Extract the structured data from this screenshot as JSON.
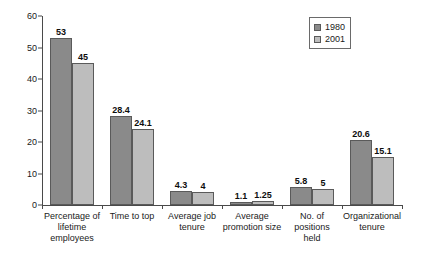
{
  "chart_data": {
    "type": "bar",
    "title": "",
    "xlabel": "",
    "ylabel": "",
    "ylim": [
      0,
      60
    ],
    "yticks": [
      0,
      10,
      20,
      30,
      40,
      50,
      60
    ],
    "grid": false,
    "legend_position": "top-right",
    "categories": [
      "Percentage of lifetime employees",
      "Time to top",
      "Average job tenure",
      "Average promotion size",
      "No. of positions held",
      "Organizational tenure"
    ],
    "category_lines": [
      [
        "Percentage of",
        "lifetime",
        "employees"
      ],
      [
        "Time to top"
      ],
      [
        "Average job",
        "tenure"
      ],
      [
        "Average",
        "promotion size"
      ],
      [
        "No. of positions",
        "held"
      ],
      [
        "Organizational",
        "tenure"
      ]
    ],
    "series": [
      {
        "name": "1980",
        "color": "#8a8a8a",
        "values": [
          53,
          28.4,
          4.3,
          1.1,
          5.8,
          20.6
        ],
        "labels": [
          "53",
          "28.4",
          "4.3",
          "1.1",
          "5.8",
          "20.6"
        ]
      },
      {
        "name": "2001",
        "color": "#bdbdbd",
        "values": [
          45,
          24.1,
          4,
          1.25,
          5,
          15.1
        ],
        "labels": [
          "45",
          "24.1",
          "4",
          "1.25",
          "5",
          "15.1"
        ]
      }
    ]
  },
  "axis": {
    "y_tick_labels": [
      "0",
      "10",
      "20",
      "30",
      "40",
      "50",
      "60"
    ]
  },
  "legend": {
    "items": [
      {
        "label": "1980"
      },
      {
        "label": "2001"
      }
    ]
  }
}
